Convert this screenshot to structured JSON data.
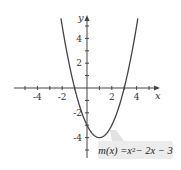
{
  "chart_data": {
    "type": "line",
    "title": "",
    "function_label": "m(x) = x² − 2x − 3",
    "legend": {
      "func_name": "m",
      "var": "x",
      "lhs": "m(x) = ",
      "rhs_base": "x",
      "rhs_exp": "2",
      "rhs_rest": " − 2x − 3"
    },
    "xlabel": "x",
    "ylabel": "y",
    "xlim": [
      -5.5,
      5.5
    ],
    "ylim": [
      -5.5,
      5.5
    ],
    "x_tick_labels": [
      "-4",
      "-2",
      "2",
      "4"
    ],
    "y_tick_labels": [
      "4",
      "2",
      "-2",
      "-4"
    ],
    "grid": false,
    "series": [
      {
        "name": "m(x) = x^2 - 2x - 3",
        "x": [
          -2,
          -1.5,
          -1,
          -0.5,
          0,
          0.5,
          1,
          1.5,
          2,
          3,
          3.5,
          4
        ],
        "y": [
          5,
          2.25,
          0,
          -1.75,
          -3,
          -3.75,
          -4,
          -3.75,
          -3,
          0,
          2.25,
          5
        ]
      }
    ],
    "annotations": [
      {
        "text": "m(x) = x² − 2x − 3",
        "points_to": [
          1,
          -4
        ]
      }
    ]
  }
}
